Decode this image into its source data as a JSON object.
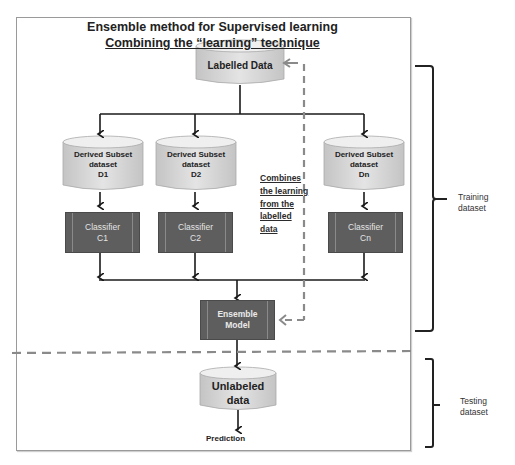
{
  "title": {
    "line1": "Ensemble method for Supervised learning",
    "line2": "Combining the “learning” technique"
  },
  "nodes": {
    "labelled_data": "Labelled Data",
    "subsets": [
      {
        "line1": "Derived Subset",
        "line2": "dataset",
        "line3": "D1"
      },
      {
        "line1": "Derived Subset",
        "line2": "dataset",
        "line3": "D2"
      },
      {
        "line1": "Derived Subset",
        "line2": "dataset",
        "line3": "Dn"
      }
    ],
    "classifiers": [
      {
        "line1": "Classifier",
        "line2": "C1"
      },
      {
        "line1": "Classifier",
        "line2": "C2"
      },
      {
        "line1": "Classifier",
        "line2": "Cn"
      }
    ],
    "ensemble": {
      "line1": "Ensemble",
      "line2": "Model"
    },
    "unlabeled": {
      "line1": "Unlabeled",
      "line2": "data"
    },
    "prediction": "Prediction"
  },
  "annotation": {
    "lines": [
      "Combines",
      "the learning",
      "from the",
      "labelled",
      "data"
    ]
  },
  "brackets": {
    "training": {
      "line1": "Training",
      "line2": "dataset"
    },
    "testing": {
      "line1": "Testing",
      "line2": "dataset"
    }
  },
  "colors": {
    "classifier_fill": "#5e5e5e",
    "cylinder_fill": "#d9d9d9",
    "dashed_line": "#8a8a8a",
    "solid_line": "#1a1a1a"
  }
}
